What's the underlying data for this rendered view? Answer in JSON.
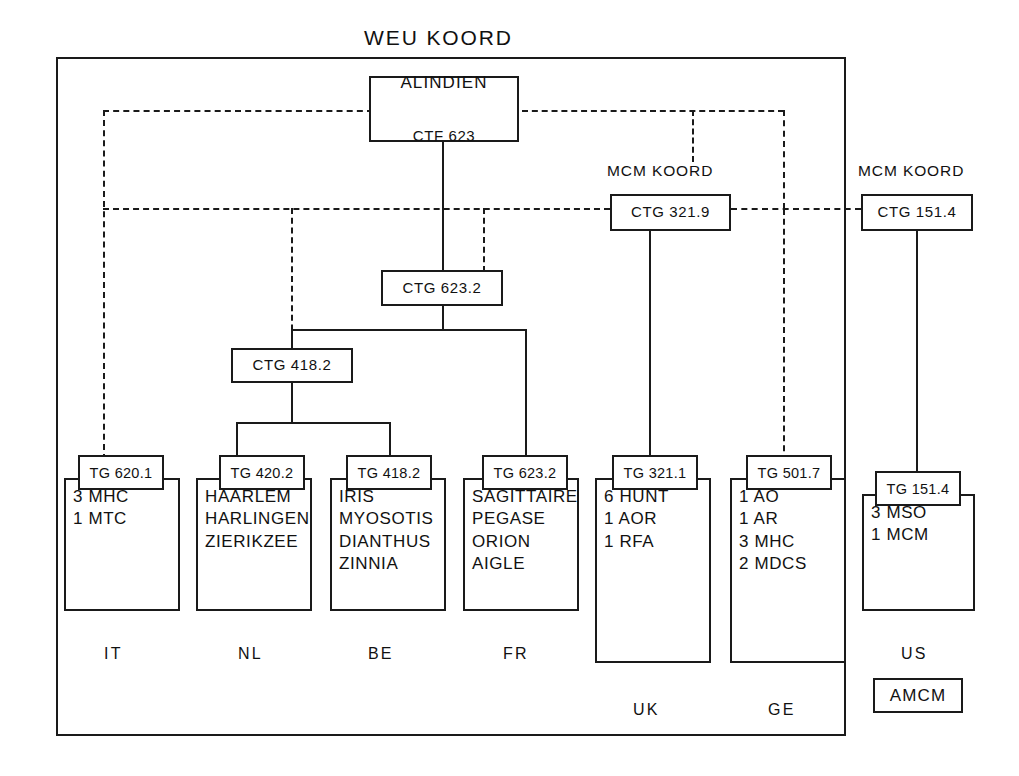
{
  "diagram": {
    "title": "WEU KOORD",
    "frame_label": "outer-command-frame"
  },
  "nodes": {
    "alindien": {
      "line1": "ALINDIEN",
      "line2": "CTF 623"
    },
    "ctg_623_2": {
      "label": "CTG 623.2"
    },
    "ctg_418_2": {
      "label": "CTG 418.2"
    },
    "mcm_koord_1": {
      "heading": "MCM KOORD",
      "label": "CTG 321.9"
    },
    "mcm_koord_2": {
      "heading": "MCM KOORD",
      "label": "CTG 151.4"
    },
    "amcm": {
      "label": "AMCM"
    }
  },
  "task_groups": [
    {
      "tg": "TG 620.1",
      "country": "IT",
      "units": [
        "3 MHC",
        "1 MTC"
      ]
    },
    {
      "tg": "TG 420.2",
      "country": "NL",
      "units": [
        "HAARLEM",
        "HARLINGEN",
        "ZIERIKZEE"
      ]
    },
    {
      "tg": "TG 418.2",
      "country": "BE",
      "units": [
        "IRIS",
        "MYOSOTIS",
        "DIANTHUS",
        "ZINNIA"
      ]
    },
    {
      "tg": "TG 623.2",
      "country": "FR",
      "units": [
        "SAGITTAIRE",
        "PEGASE",
        "ORION",
        "AIGLE"
      ]
    },
    {
      "tg": "TG 321.1",
      "country": "UK",
      "units": [
        "6 HUNT",
        "1 AOR",
        "1 RFA"
      ]
    },
    {
      "tg": "TG 501.7",
      "country": "GE",
      "units": [
        "1 AO",
        "1 AR",
        "3 MHC",
        "2 MDCS"
      ]
    },
    {
      "tg": "TG 151.4",
      "country": "US",
      "units": [
        "3 MSO",
        "1 MCM"
      ]
    }
  ],
  "colors": {
    "ink": "#1a1a1a",
    "paper": "#ffffff"
  }
}
